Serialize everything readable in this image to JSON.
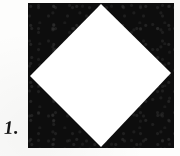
{
  "page": {
    "background_color": "#fdfdfc",
    "width": 180,
    "height": 156
  },
  "caption": {
    "label": "1."
  },
  "figure": {
    "name": "square-with-inscribed-diamond",
    "square": {
      "fill_color": "#0d0d0d",
      "x": 28,
      "y": 3,
      "width": 146,
      "height": 145
    },
    "diamond": {
      "fill_color": "#ffffff",
      "vertices": [
        {
          "name": "top",
          "x": 101,
          "y": 4
        },
        {
          "name": "right",
          "x": 171,
          "y": 73
        },
        {
          "name": "bottom",
          "x": 101,
          "y": 147
        },
        {
          "name": "left",
          "x": 30,
          "y": 76
        }
      ]
    }
  },
  "chart_data": {
    "type": "diagram",
    "title": "1.",
    "shapes": [
      {
        "shape": "square",
        "fill": "#0d0d0d",
        "points": [
          [
            28,
            3
          ],
          [
            174,
            3
          ],
          [
            174,
            148
          ],
          [
            28,
            148
          ]
        ]
      },
      {
        "shape": "diamond",
        "fill": "#ffffff",
        "points": [
          [
            101,
            4
          ],
          [
            171,
            73
          ],
          [
            101,
            147
          ],
          [
            30,
            76
          ]
        ]
      }
    ],
    "xlabel": "",
    "ylabel": "",
    "grid": false,
    "legend": false
  }
}
